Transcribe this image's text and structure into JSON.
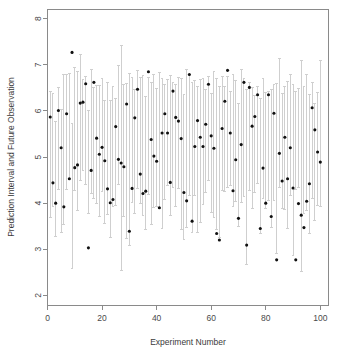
{
  "chart_data": {
    "type": "scatter",
    "title": "",
    "xlabel": "Experiment Number",
    "ylabel": "Prediction Interval and Future Observation",
    "xlim": [
      0,
      103
    ],
    "ylim": [
      1.78,
      8.2
    ],
    "grid": false,
    "legend": null,
    "xticks": [
      0,
      20,
      40,
      60,
      80,
      100
    ],
    "xticklabels": [
      "0",
      "20",
      "40",
      "60",
      "80",
      "100"
    ],
    "yticks": [
      2,
      3,
      4,
      5,
      6,
      7,
      8
    ],
    "yticklabels": [
      "2",
      "3",
      "4",
      "5",
      "6",
      "7",
      "8"
    ],
    "series": [
      {
        "name": "Future Observation",
        "marker": "filled-circle",
        "color": "#101010",
        "x": [
          1,
          2,
          3,
          4,
          5,
          6,
          7,
          8,
          9,
          10,
          11,
          12,
          13,
          14,
          15,
          16,
          17,
          18,
          19,
          20,
          21,
          22,
          23,
          24,
          25,
          26,
          27,
          28,
          29,
          30,
          31,
          32,
          33,
          34,
          35,
          36,
          37,
          38,
          39,
          40,
          41,
          42,
          43,
          44,
          45,
          46,
          47,
          48,
          49,
          50,
          51,
          52,
          53,
          54,
          55,
          56,
          57,
          58,
          59,
          60,
          61,
          62,
          63,
          64,
          65,
          66,
          67,
          68,
          69,
          70,
          71,
          72,
          73,
          74,
          75,
          76,
          77,
          78,
          79,
          80,
          81,
          82,
          83,
          84,
          85,
          86,
          87,
          88,
          89,
          90,
          91,
          92,
          93,
          94,
          95,
          96,
          97,
          98,
          99,
          100
        ],
        "values": [
          5.87,
          4.44,
          4.0,
          6.01,
          5.2,
          3.92,
          5.94,
          4.53,
          7.27,
          4.77,
          4.83,
          6.17,
          6.19,
          6.59,
          3.03,
          4.71,
          6.62,
          5.41,
          5.06,
          5.21,
          4.92,
          4.31,
          4.01,
          4.08,
          5.66,
          4.95,
          4.87,
          4.79,
          6.15,
          3.39,
          4.32,
          5.85,
          6.47,
          4.63,
          4.21,
          4.26,
          6.85,
          5.38,
          5.02,
          4.91,
          3.9,
          5.52,
          5.94,
          5.52,
          4.45,
          6.43,
          5.86,
          5.78,
          5.4,
          4.23,
          4.05,
          6.79,
          3.61,
          5.23,
          5.79,
          5.43,
          5.23,
          5.71,
          6.58,
          5.46,
          5.19,
          3.34,
          3.2,
          5.62,
          6.21,
          6.88,
          5.52,
          4.27,
          4.94,
          3.67,
          5.27,
          6.62,
          3.09,
          6.51,
          5.67,
          5.88,
          6.35,
          3.45,
          4.76,
          4.0,
          6.35,
          3.71,
          5.95,
          2.77,
          5.08,
          4.48,
          5.43,
          4.53,
          5.2,
          4.33,
          2.77,
          3.99,
          3.74,
          3.47,
          4.04,
          4.42,
          6.07,
          5.59,
          5.11,
          4.89
        ]
      }
    ],
    "intervals": {
      "name": "Prediction Interval",
      "color": "#cfcfcf",
      "lower": [
        3.68,
        3.92,
        3.28,
        4.3,
        3.37,
        3.54,
        4.3,
        4.53,
        2.58,
        4.27,
        3.84,
        4.49,
        4.71,
        4.4,
        3.77,
        4.2,
        4.1,
        4.0,
        3.71,
        4.26,
        3.55,
        3.76,
        3.26,
        3.93,
        3.95,
        4.41,
        2.54,
        3.72,
        3.24,
        3.09,
        4.01,
        3.77,
        4.32,
        4.0,
        3.74,
        3.42,
        4.18,
        3.54,
        3.9,
        3.93,
        3.88,
        3.44,
        4.07,
        4.38,
        3.73,
        4.35,
        3.92,
        4.32,
        3.43,
        3.21,
        3.47,
        4.16,
        3.36,
        4.16,
        3.36,
        3.59,
        3.98,
        4.23,
        4.49,
        3.79,
        3.68,
        3.42,
        3.26,
        4.28,
        4.26,
        4.33,
        4.39,
        3.93,
        4.04,
        3.5,
        4.02,
        4.14,
        2.68,
        4.27,
        3.88,
        4.23,
        4.42,
        3.35,
        4.09,
        3.89,
        4.06,
        3.47,
        4.05,
        2.91,
        4.34,
        3.89,
        3.86,
        3.46,
        4.16,
        2.87,
        4.3,
        4.33,
        2.51,
        3.78,
        3.83,
        3.35,
        4.1,
        3.62,
        3.94,
        3.92
      ],
      "upper": [
        6.42,
        6.38,
        5.76,
        6.5,
        6.04,
        6.78,
        6.8,
        6.82,
        5.72,
        6.95,
        6.85,
        7.23,
        6.69,
        6.74,
        6.0,
        6.89,
        6.5,
        6.56,
        6.55,
        6.7,
        6.23,
        6.61,
        6.22,
        6.52,
        6.27,
        6.98,
        7.43,
        6.58,
        6.6,
        6.82,
        6.72,
        6.47,
        6.88,
        6.72,
        6.77,
        6.32,
        6.73,
        6.62,
        6.78,
        6.48,
        6.84,
        6.71,
        6.57,
        6.68,
        6.76,
        6.62,
        6.58,
        6.72,
        6.7,
        6.36,
        6.89,
        6.78,
        6.62,
        6.67,
        6.53,
        6.69,
        6.71,
        6.47,
        6.74,
        6.38,
        6.85,
        6.71,
        6.54,
        6.74,
        6.53,
        6.74,
        6.42,
        6.78,
        6.66,
        6.16,
        6.9,
        6.71,
        6.47,
        6.61,
        6.51,
        6.33,
        6.54,
        6.26,
        6.71,
        6.41,
        6.42,
        6.46,
        6.58,
        6.6,
        7.13,
        6.38,
        6.53,
        6.63,
        6.78,
        6.58,
        6.42,
        6.48,
        7.09,
        6.52,
        6.78,
        6.35,
        6.61,
        6.17,
        6.41,
        7.1
      ]
    }
  }
}
